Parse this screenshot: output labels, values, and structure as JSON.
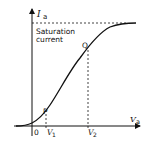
{
  "diagram": {
    "type": "characteristic-curve",
    "axes": {
      "y_label": "I",
      "y_label_sub": "a",
      "x_label": "V",
      "x_label_sub": "a",
      "origin_label": "0"
    },
    "saturation": {
      "line1": "Saturation",
      "line2": "current"
    },
    "points": [
      {
        "label": "P",
        "x_marker": "V",
        "x_marker_sub": "1"
      },
      {
        "label": "Q",
        "x_marker": "V",
        "x_marker_sub": "2"
      }
    ],
    "colors": {
      "line": "#111111",
      "background": "#ffffff"
    }
  }
}
